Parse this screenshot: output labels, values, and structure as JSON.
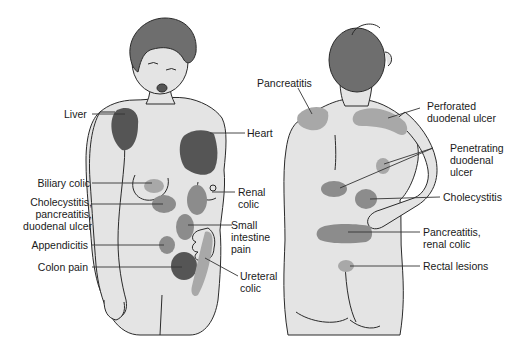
{
  "colors": {
    "skin": "#e4e4e4",
    "outline": "#2a2a2a",
    "hair": "#6e6e6e",
    "dark_region": "#555555",
    "mid_region": "#8c8c8c",
    "light_region": "#a8a8a8",
    "leader": "#333333"
  },
  "front_figure": {
    "labels": [
      {
        "id": "liver",
        "text": "Liver"
      },
      {
        "id": "heart",
        "text": "Heart"
      },
      {
        "id": "biliary",
        "text": "Biliary colic"
      },
      {
        "id": "chole_front",
        "text": "Cholecystitis,\npancreatitis,\nduodenal ulcer"
      },
      {
        "id": "renal",
        "text": "Renal\ncolic"
      },
      {
        "id": "small_int",
        "text": "Small\nintestine\npain"
      },
      {
        "id": "appendicitis",
        "text": "Appendicitis"
      },
      {
        "id": "colon",
        "text": "Colon pain"
      },
      {
        "id": "ureteral",
        "text": "Ureteral\ncolic"
      }
    ]
  },
  "back_figure": {
    "labels": [
      {
        "id": "pancreatitis",
        "text": "Pancreatitis"
      },
      {
        "id": "perforated",
        "text": "Perforated\nduodenal ulcer"
      },
      {
        "id": "penetrating",
        "text": "Penetrating\nduodenal\nulcer"
      },
      {
        "id": "chole_back",
        "text": "Cholecystitis"
      },
      {
        "id": "panc_renal",
        "text": "Pancreatitis,\nrenal colic"
      },
      {
        "id": "rectal",
        "text": "Rectal lesions"
      }
    ]
  }
}
